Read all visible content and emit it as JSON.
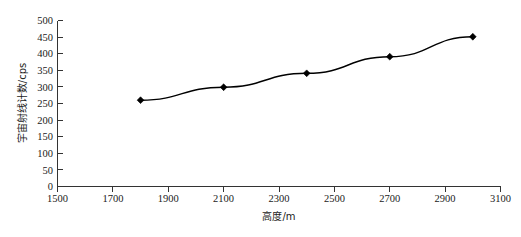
{
  "chart_data": {
    "type": "line",
    "title": "",
    "subtitle": "",
    "xlabel": "高度/m",
    "ylabel": "宇宙射线计数/cps",
    "xlim": [
      1500,
      3100
    ],
    "ylim": [
      0,
      500
    ],
    "xticks": [
      1500,
      1700,
      1900,
      2100,
      2300,
      2500,
      2700,
      2900,
      3100
    ],
    "yticks": [
      0,
      50,
      100,
      150,
      200,
      250,
      300,
      350,
      400,
      450,
      500
    ],
    "grid": false,
    "legend": null,
    "legend_position": "none",
    "marker": "diamond",
    "line_color": "#000000",
    "marker_color": "#000000",
    "background": "#ffffff",
    "x": [
      1800,
      2100,
      2400,
      2700,
      3000
    ],
    "values": [
      260,
      299,
      341,
      391,
      451
    ],
    "series": [
      {
        "name": "宇宙射线计数",
        "x": [
          1800,
          2100,
          2400,
          2700,
          3000
        ],
        "values": [
          260,
          299,
          341,
          391,
          451
        ]
      }
    ],
    "annotations": []
  },
  "figure": {
    "caption_fragment": ""
  }
}
